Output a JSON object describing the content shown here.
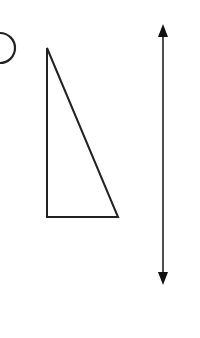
{
  "diagram": {
    "background": "#ffffff",
    "stroke_color": "#222222",
    "shapes": [
      {
        "name": "partial-circle-edge",
        "type": "arc",
        "description": "Right edge of a circle cut off at left border"
      },
      {
        "name": "right-triangle",
        "type": "polygon",
        "points": [
          [
            47,
            48
          ],
          [
            47,
            217
          ],
          [
            118,
            217
          ]
        ]
      },
      {
        "name": "double-headed-arrow",
        "type": "line",
        "x": 163,
        "y1": 24,
        "y2": 285,
        "arrowheads": [
          "up",
          "down"
        ]
      }
    ]
  }
}
